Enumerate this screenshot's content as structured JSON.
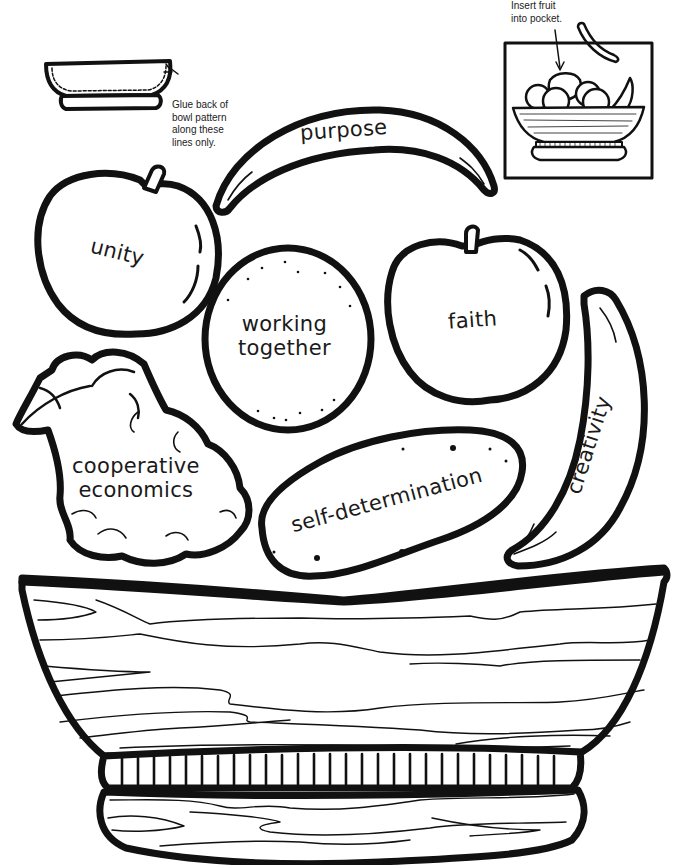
{
  "worksheet": {
    "instructions": {
      "glue_note": [
        "Glue back of",
        "bowl pattern",
        "along these",
        "lines only."
      ],
      "insert_note": [
        "Insert fruit",
        "into pocket."
      ]
    },
    "fruits": [
      {
        "id": "banana-top",
        "shape": "banana",
        "label": "purpose"
      },
      {
        "id": "apple-left",
        "shape": "apple",
        "label": "unity"
      },
      {
        "id": "orange",
        "shape": "orange",
        "label_lines": [
          "working",
          "together"
        ]
      },
      {
        "id": "apple-right",
        "shape": "apple",
        "label": "faith"
      },
      {
        "id": "banana-right",
        "shape": "banana",
        "label": "creativity"
      },
      {
        "id": "grapes",
        "shape": "grapes",
        "label_lines": [
          "cooperative",
          "economics"
        ]
      },
      {
        "id": "potato",
        "shape": "sweet-potato",
        "label": "self-determination"
      }
    ],
    "bowl": {
      "shape": "wooden-bowl",
      "rim_beads": 28
    },
    "diagrams": {
      "glue_diagram": "small-bowl-with-dashed-glue-line",
      "pocket_diagram": "fruit-bowl-assembled-with-banana-inserted"
    }
  }
}
